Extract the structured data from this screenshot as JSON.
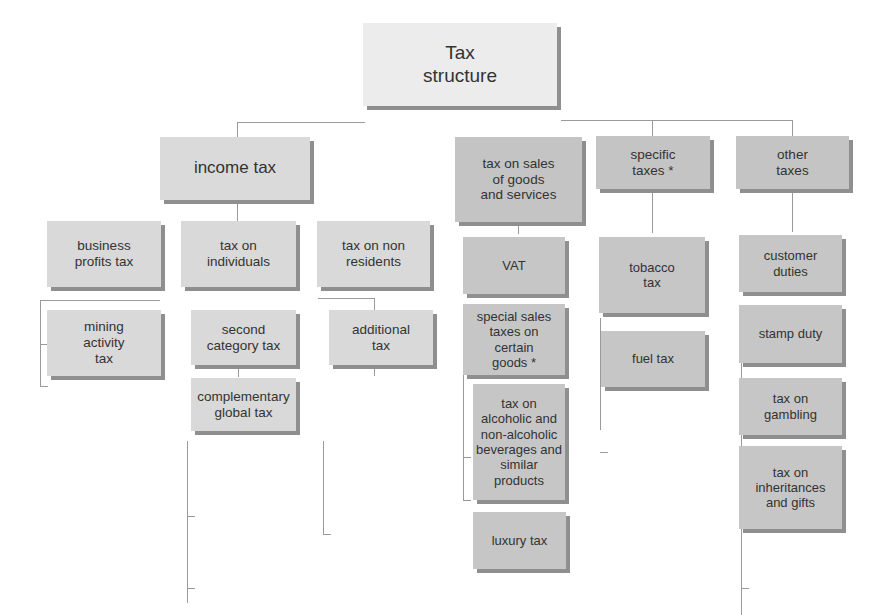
{
  "diagram": {
    "root": {
      "label": "Tax\nstructure"
    },
    "branches": [
      {
        "label": "income tax",
        "children": [
          {
            "label": "business profits tax"
          },
          {
            "label": "mining activity tax"
          },
          {
            "label": "tax on individuals",
            "children": [
              {
                "label": "second category tax"
              },
              {
                "label": "complementary global tax"
              }
            ]
          },
          {
            "label": "tax on non residents",
            "children": [
              {
                "label": "additional tax"
              }
            ]
          }
        ]
      },
      {
        "label": "tax on sales of goods and services",
        "children": [
          {
            "label": "VAT"
          },
          {
            "label": "special sales taxes on certain goods *",
            "children": [
              {
                "label": "tax on alcoholic and non-alcoholic beverages and similar products"
              },
              {
                "label": "luxury tax"
              }
            ]
          }
        ]
      },
      {
        "label": "specific taxes *",
        "children": [
          {
            "label": "tobacco tax"
          },
          {
            "label": "fuel tax"
          }
        ]
      },
      {
        "label": "other taxes",
        "children": [
          {
            "label": "customer duties"
          },
          {
            "label": "stamp duty"
          },
          {
            "label": "tax on gambling"
          },
          {
            "label": "tax on inheritances and gifts"
          }
        ]
      }
    ]
  },
  "labels": {
    "root_line1": "Tax",
    "root_line2": "structure",
    "income_tax": "income tax",
    "business_profits_1": "business",
    "business_profits_2": "profits tax",
    "mining_1": "mining",
    "mining_2": "activity",
    "mining_3": "tax",
    "individuals_1": "tax on",
    "individuals_2": "individuals",
    "second_cat_1": "second",
    "second_cat_2": "category tax",
    "compl_1": "complementary",
    "compl_2": "global tax",
    "nonres_1": "tax on non",
    "nonres_2": "residents",
    "additional_1": "additional",
    "additional_2": "tax",
    "sales_1": "tax on sales",
    "sales_2": "of goods",
    "sales_3": "and services",
    "vat": "VAT",
    "special_1": "special sales",
    "special_2": "taxes on",
    "special_3": "certain",
    "special_4": "goods *",
    "alc_1": "tax on",
    "alc_2": "alcoholic and",
    "alc_3": "non-alcoholic",
    "alc_4": "beverages and",
    "alc_5": "similar",
    "alc_6": "products",
    "luxury": "luxury tax",
    "specific_1": "specific",
    "specific_2": "taxes *",
    "tobacco_1": "tobacco",
    "tobacco_2": "tax",
    "fuel": "fuel tax",
    "other_1": "other",
    "other_2": "taxes",
    "customs_1": "customer",
    "customs_2": "duties",
    "stamp": "stamp duty",
    "gambling_1": "tax on",
    "gambling_2": "gambling",
    "inherit_1": "tax on",
    "inherit_2": "inheritances",
    "inherit_3": "and gifts"
  },
  "colors": {
    "root_fill": "#ececec",
    "income_fill": "#dadada",
    "sales_fill": "#c4c4c4",
    "shadow": "#8f8f8f",
    "connector": "#9a9a9a",
    "text": "#333333"
  }
}
